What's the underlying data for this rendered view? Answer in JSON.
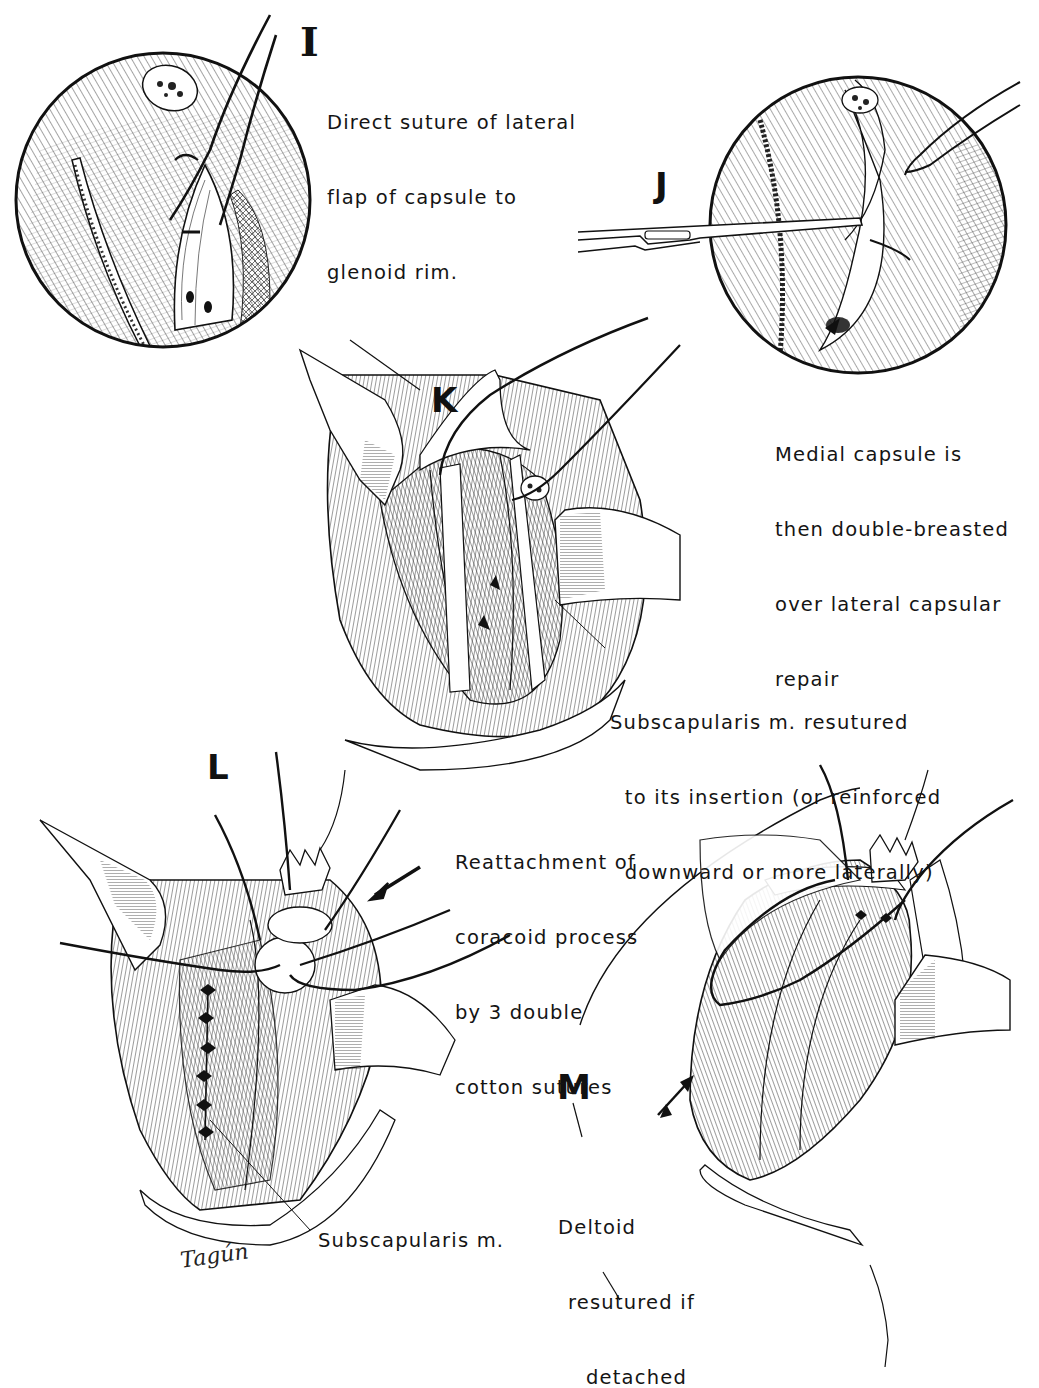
{
  "figure": {
    "panels": [
      {
        "id": "I",
        "letter": "I",
        "caption_lines": [
          "Direct suture of lateral",
          "flap of capsule to",
          "glenoid rim."
        ]
      },
      {
        "id": "J",
        "letter": "J",
        "caption_lines": [
          "Medial capsule is",
          "then double-breasted",
          "over lateral capsular",
          "repair"
        ]
      },
      {
        "id": "K",
        "letter": "K",
        "caption_lines": [
          "Subscapularis m. resutured",
          "  to its insertion (or reinforced",
          "  downward or more laterally)"
        ]
      },
      {
        "id": "L",
        "letter": "L",
        "caption_lines": [
          "Reattachment of",
          "coracoid process",
          "by 3 double",
          "cotton sutures"
        ],
        "secondary_label": "Subscapularis m."
      },
      {
        "id": "M",
        "letter": "M",
        "caption_lines": [
          "Deltoid",
          "resutured if",
          "detached"
        ]
      }
    ],
    "signature": "Tagún",
    "colors": {
      "ink": "#111111",
      "paper": "#ffffff",
      "hatch": "#2a2a2a"
    }
  }
}
